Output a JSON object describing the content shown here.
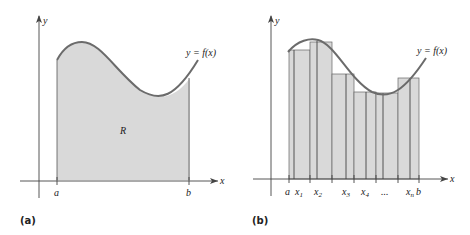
{
  "figure": {
    "panels": [
      {
        "id": "a",
        "label": "(a)",
        "axis_x": "x",
        "axis_y": "y",
        "curve_label": "y = f(x)",
        "region_label": "R",
        "ticks": [
          "a",
          "b"
        ]
      },
      {
        "id": "b",
        "label": "(b)",
        "axis_x": "x",
        "axis_y": "y",
        "curve_label": "y = f(x)",
        "ticks": [
          "a",
          "x1",
          "x2",
          "x3",
          "x4",
          "...",
          "xn",
          "b"
        ]
      }
    ],
    "colors": {
      "curve": "#6b6b6b",
      "fill": "#d9d9d9",
      "axis": "#444444"
    }
  }
}
